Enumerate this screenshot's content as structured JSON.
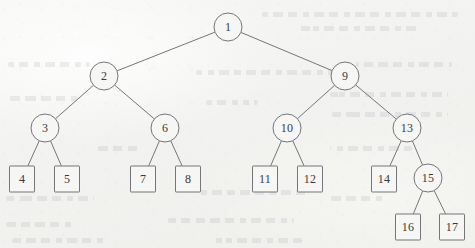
{
  "figure": {
    "caption": "",
    "type": "binary-tree-diagram",
    "background_color": "#f4f4f2",
    "stroke_color": "#76767a",
    "text_color": "#3a3a3c"
  },
  "legend": {
    "internal_node_shape": "circle",
    "leaf_node_shape": "square"
  },
  "nodes": [
    {
      "id": "n1",
      "label": "1",
      "shape": "circle",
      "x": 228,
      "y": 27,
      "level": 0
    },
    {
      "id": "n2",
      "label": "2",
      "shape": "circle",
      "x": 104,
      "y": 76,
      "level": 1
    },
    {
      "id": "n9",
      "label": "9",
      "shape": "circle",
      "x": 345,
      "y": 76,
      "level": 1
    },
    {
      "id": "n3",
      "label": "3",
      "shape": "circle",
      "x": 45,
      "y": 128,
      "level": 2
    },
    {
      "id": "n6",
      "label": "6",
      "shape": "circle",
      "x": 165,
      "y": 128,
      "level": 2
    },
    {
      "id": "n10",
      "label": "10",
      "shape": "circle",
      "x": 287,
      "y": 128,
      "level": 2
    },
    {
      "id": "n13",
      "label": "13",
      "shape": "circle",
      "x": 407,
      "y": 128,
      "level": 2
    },
    {
      "id": "n4",
      "label": "4",
      "shape": "square",
      "x": 22,
      "y": 179,
      "level": 3
    },
    {
      "id": "n5",
      "label": "5",
      "shape": "square",
      "x": 67,
      "y": 179,
      "level": 3
    },
    {
      "id": "n7",
      "label": "7",
      "shape": "square",
      "x": 143,
      "y": 179,
      "level": 3
    },
    {
      "id": "n8",
      "label": "8",
      "shape": "square",
      "x": 188,
      "y": 179,
      "level": 3
    },
    {
      "id": "n11",
      "label": "11",
      "shape": "square",
      "x": 265,
      "y": 179,
      "level": 3
    },
    {
      "id": "n12",
      "label": "12",
      "shape": "square",
      "x": 310,
      "y": 179,
      "level": 3
    },
    {
      "id": "n14",
      "label": "14",
      "shape": "square",
      "x": 384,
      "y": 179,
      "level": 3
    },
    {
      "id": "n15",
      "label": "15",
      "shape": "circle",
      "x": 428,
      "y": 178,
      "level": 3
    },
    {
      "id": "n16",
      "label": "16",
      "shape": "square",
      "x": 408,
      "y": 227,
      "level": 4
    },
    {
      "id": "n17",
      "label": "17",
      "shape": "square",
      "x": 452,
      "y": 227,
      "level": 4
    }
  ],
  "edges": [
    {
      "from": "n1",
      "to": "n2"
    },
    {
      "from": "n1",
      "to": "n9"
    },
    {
      "from": "n2",
      "to": "n3"
    },
    {
      "from": "n2",
      "to": "n6"
    },
    {
      "from": "n9",
      "to": "n10"
    },
    {
      "from": "n9",
      "to": "n13"
    },
    {
      "from": "n3",
      "to": "n4"
    },
    {
      "from": "n3",
      "to": "n5"
    },
    {
      "from": "n6",
      "to": "n7"
    },
    {
      "from": "n6",
      "to": "n8"
    },
    {
      "from": "n10",
      "to": "n11"
    },
    {
      "from": "n10",
      "to": "n12"
    },
    {
      "from": "n13",
      "to": "n14"
    },
    {
      "from": "n13",
      "to": "n15"
    },
    {
      "from": "n15",
      "to": "n16"
    },
    {
      "from": "n15",
      "to": "n17"
    }
  ],
  "bleed_through_lines": [
    {
      "x": 262,
      "y": 12,
      "width": 196
    },
    {
      "x": 300,
      "y": 26,
      "width": 120
    },
    {
      "x": 8,
      "y": 62,
      "width": 82
    },
    {
      "x": 196,
      "y": 70,
      "width": 150
    },
    {
      "x": 356,
      "y": 62,
      "width": 96
    },
    {
      "x": 6,
      "y": 96,
      "width": 72
    },
    {
      "x": 206,
      "y": 100,
      "width": 52
    },
    {
      "x": 330,
      "y": 92,
      "width": 118
    },
    {
      "x": 332,
      "y": 112,
      "width": 116
    },
    {
      "x": 96,
      "y": 146,
      "width": 44
    },
    {
      "x": 330,
      "y": 146,
      "width": 82
    },
    {
      "x": 6,
      "y": 196,
      "width": 88
    },
    {
      "x": 196,
      "y": 190,
      "width": 110
    },
    {
      "x": 330,
      "y": 196,
      "width": 56
    },
    {
      "x": 6,
      "y": 222,
      "width": 70
    },
    {
      "x": 168,
      "y": 218,
      "width": 126
    },
    {
      "x": 12,
      "y": 238,
      "width": 96
    },
    {
      "x": 210,
      "y": 238,
      "width": 92
    }
  ]
}
